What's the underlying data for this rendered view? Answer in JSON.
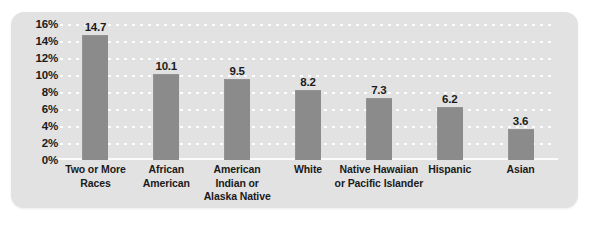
{
  "chart_data": {
    "type": "bar",
    "title": "",
    "subtitle": "",
    "xlabel": "",
    "ylabel": "",
    "ylim": [
      0,
      16
    ],
    "grid": true,
    "legend": null,
    "orientation": "vertical",
    "value_labels_shown": true,
    "categories": [
      "Two or More Races",
      "African American",
      "American Indian or Alaska Native",
      "White",
      "Native Hawaiian or Pacific Islander",
      "Hispanic",
      "Asian"
    ],
    "category_lines": [
      [
        "Two or More",
        "Races"
      ],
      [
        "African",
        "American"
      ],
      [
        "American",
        "Indian or",
        "Alaska Native"
      ],
      [
        "White"
      ],
      [
        "Native Hawaiian",
        "or Pacific Islander"
      ],
      [
        "Hispanic"
      ],
      [
        "Asian"
      ]
    ],
    "values": [
      14.7,
      10.1,
      9.5,
      8.2,
      7.3,
      6.2,
      3.6
    ],
    "value_labels": [
      "14.7",
      "10.1",
      "9.5",
      "8.2",
      "7.3",
      "6.2",
      "3.6"
    ],
    "y_ticks": [
      16,
      14,
      12,
      10,
      8,
      6,
      4,
      2,
      0
    ],
    "y_tick_labels": [
      "16%",
      "14%",
      "12%",
      "10%",
      "8%",
      "6%",
      "4%",
      "2%",
      "0%"
    ],
    "colors": {
      "bar": "#8b8b8b",
      "panel_background": "#e2e2e2",
      "gridline": "#ffffff",
      "text": "#1b1b1b",
      "page_background": "#ffffff"
    }
  }
}
